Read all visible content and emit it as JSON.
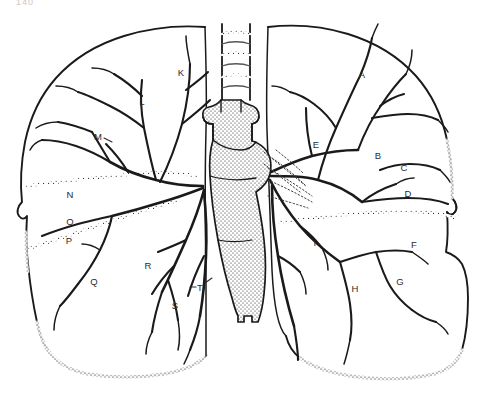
{
  "figure": {
    "page_number": "140",
    "background_color": "#ffffff",
    "ink_color": "#1a1a1a",
    "label_color": "#2b2b2b"
  },
  "labels": [
    {
      "id": "A",
      "text": "A",
      "x": 362,
      "y": 74,
      "lung": "right",
      "leader": false
    },
    {
      "id": "B",
      "text": "B",
      "x": 378,
      "y": 155,
      "lung": "right",
      "leader": false
    },
    {
      "id": "C",
      "text": "C",
      "x": 404,
      "y": 167,
      "lung": "right",
      "leader": false
    },
    {
      "id": "D",
      "text": "D",
      "x": 408,
      "y": 193,
      "lung": "right",
      "leader": false
    },
    {
      "id": "E",
      "text": "E",
      "x": 316,
      "y": 144,
      "lung": "right",
      "leader": false
    },
    {
      "id": "F",
      "text": "F",
      "x": 414,
      "y": 244,
      "lung": "right",
      "leader": false
    },
    {
      "id": "G",
      "text": "G",
      "x": 400,
      "y": 281,
      "lung": "right",
      "leader": false
    },
    {
      "id": "H",
      "text": "H",
      "x": 355,
      "y": 288,
      "lung": "right",
      "leader": false
    },
    {
      "id": "I",
      "text": "I",
      "x": 315,
      "y": 242,
      "lung": "right",
      "leader": false
    },
    {
      "id": "K",
      "text": "K",
      "x": 181,
      "y": 72,
      "lung": "left",
      "leader": false
    },
    {
      "id": "L",
      "text": "L",
      "x": 142,
      "y": 101,
      "lung": "left",
      "leader": false
    },
    {
      "id": "M",
      "text": "M",
      "x": 98,
      "y": 136,
      "lung": "left",
      "leader": true
    },
    {
      "id": "N",
      "text": "N",
      "x": 70,
      "y": 194,
      "lung": "left",
      "leader": false
    },
    {
      "id": "O",
      "text": "O",
      "x": 70,
      "y": 221,
      "lung": "left",
      "leader": false
    },
    {
      "id": "P",
      "text": "P",
      "x": 69,
      "y": 240,
      "lung": "left",
      "leader": false
    },
    {
      "id": "Q",
      "text": "Q",
      "x": 94,
      "y": 281,
      "lung": "left",
      "leader": false
    },
    {
      "id": "R",
      "text": "R",
      "x": 148,
      "y": 265,
      "lung": "left",
      "leader": false
    },
    {
      "id": "S",
      "text": "S",
      "x": 175,
      "y": 305,
      "lung": "left",
      "leader": false
    },
    {
      "id": "T",
      "text": "T",
      "x": 200,
      "y": 287,
      "lung": "left",
      "leader": true
    }
  ],
  "structures": {
    "trachea": "trachea-with-cartilage-rings",
    "mediastinum": "stippled-mediastinal-column",
    "left_lung": "left-lung-outline",
    "right_lung": "right-lung-outline",
    "left_fissure": "left-oblique-fissure-dotted",
    "right_fissure": "right-horizontal-fissure-dotted",
    "bronchial_tree_left": "left-bronchial-tree",
    "bronchial_tree_right": "right-bronchial-tree",
    "diaphragmatic_border": "stippled-inferior-border"
  }
}
